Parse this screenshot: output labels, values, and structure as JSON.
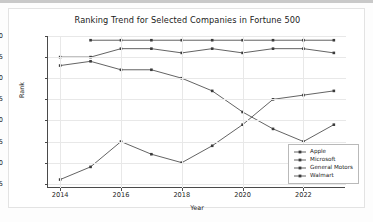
{
  "chart_data": {
    "type": "line",
    "title": "Ranking Trend for Selected Companies in Fortune 500",
    "xlabel": "Year",
    "ylabel": "Rank",
    "x": [
      2014,
      2015,
      2016,
      2017,
      2018,
      2019,
      2020,
      2021,
      2022,
      2023
    ],
    "xticks": [
      "2014",
      "2016",
      "2018",
      "2020",
      "2022"
    ],
    "xtick_values": [
      2014,
      2016,
      2018,
      2020,
      2022
    ],
    "yticks": [
      "0",
      "5",
      "10",
      "15",
      "20",
      "25",
      "30",
      "35"
    ],
    "ytick_values": [
      0,
      5,
      10,
      15,
      20,
      25,
      30,
      35
    ],
    "xlim": [
      2013.6,
      2023.4
    ],
    "ylim": [
      0,
      36
    ],
    "y_inverted": true,
    "grid": true,
    "legend_position": "lower right",
    "line_color": "#3b3b3b",
    "marker": "square",
    "series": [
      {
        "name": "Apple",
        "x": [
          2014,
          2015,
          2016,
          2017,
          2018,
          2019,
          2020,
          2021,
          2022,
          2023
        ],
        "values": [
          7,
          6,
          8,
          8,
          10,
          13,
          18,
          22,
          25,
          21
        ]
      },
      {
        "name": "Microsoft",
        "x": [
          2014,
          2015,
          2016,
          2017,
          2018,
          2019,
          2020,
          2021,
          2022,
          2023
        ],
        "values": [
          5,
          5,
          3,
          3,
          4,
          3,
          4,
          3,
          3,
          4
        ]
      },
      {
        "name": "General Motors",
        "x": [
          2014,
          2015,
          2016,
          2017,
          2018,
          2019,
          2020,
          2021,
          2022,
          2023
        ],
        "values": [
          34,
          31,
          25,
          28,
          30,
          26,
          21,
          15,
          14,
          13
        ]
      },
      {
        "name": "Walmart",
        "x": [
          2015,
          2016,
          2017,
          2018,
          2019,
          2020,
          2021,
          2022,
          2023
        ],
        "values": [
          1,
          1,
          1,
          1,
          1,
          1,
          1,
          1,
          1
        ]
      }
    ]
  },
  "legend": {
    "items": [
      {
        "label": "Apple"
      },
      {
        "label": "Microsoft"
      },
      {
        "label": "General Motors"
      },
      {
        "label": "Walmart"
      }
    ]
  }
}
